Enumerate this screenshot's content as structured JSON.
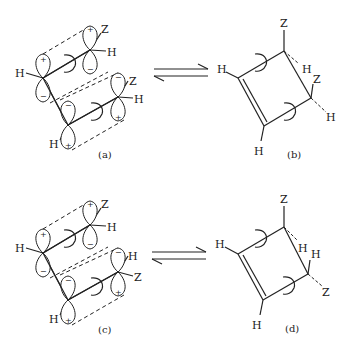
{
  "figure": {
    "panels": [
      {
        "id": "a",
        "caption": "(a)",
        "type": "p-orbital-diagram",
        "atoms": {
          "top_left": "H",
          "top_right_up": "Z",
          "top_right_side": "H",
          "bottom_right_up": "Z",
          "bottom_right_side": "H",
          "bottom_left": "H"
        },
        "signs": {
          "tl_up": "+",
          "tl_down": "−",
          "tr_up": "+",
          "tr_down": "−",
          "bl_up": "−",
          "bl_down": "+",
          "br_up": "−",
          "br_down": "+"
        }
      },
      {
        "id": "b",
        "caption": "(b)",
        "type": "cyclobutene",
        "atoms": {
          "left": "H",
          "bottom": "H",
          "top_sub": "Z",
          "top_dash": "H",
          "right_sub": "Z",
          "right_dash": "H"
        }
      },
      {
        "id": "c",
        "caption": "(c)",
        "type": "p-orbital-diagram",
        "atoms": {
          "top_left": "H",
          "top_right_up": "Z",
          "top_right_side": "H",
          "bottom_right_up": "H",
          "bottom_right_side": "Z",
          "bottom_left": "H"
        },
        "signs": {
          "tl_up": "+",
          "tl_down": "−",
          "tr_up": "+",
          "tr_down": "−",
          "bl_up": "−",
          "bl_down": "+",
          "br_up": "−",
          "br_down": "+"
        }
      },
      {
        "id": "d",
        "caption": "(d)",
        "type": "cyclobutene",
        "atoms": {
          "left": "H",
          "bottom": "H",
          "top_sub": "Z",
          "top_dash": "H",
          "right_sub": "H",
          "right_dash": "Z"
        }
      }
    ],
    "equilibrium_arrows": [
      {
        "from": "a",
        "to": "b",
        "symbol": "⇌"
      },
      {
        "from": "c",
        "to": "d",
        "symbol": "⇌"
      }
    ]
  }
}
